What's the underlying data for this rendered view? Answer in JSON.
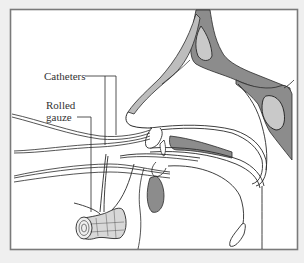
{
  "figure": {
    "type": "anatomical-diagram",
    "colors": {
      "background": "#efefef",
      "panel": "#ffffff",
      "frame": "#7a7a7a",
      "line": "#2a2a2a",
      "bone": "#8c8c8c",
      "bone_light": "#bdbdbd",
      "sinus": "#c9c9c9"
    },
    "labels": {
      "catheters": "Catheters",
      "rolled_gauze_line1": "Rolled",
      "rolled_gauze_line2": "gauze"
    }
  }
}
